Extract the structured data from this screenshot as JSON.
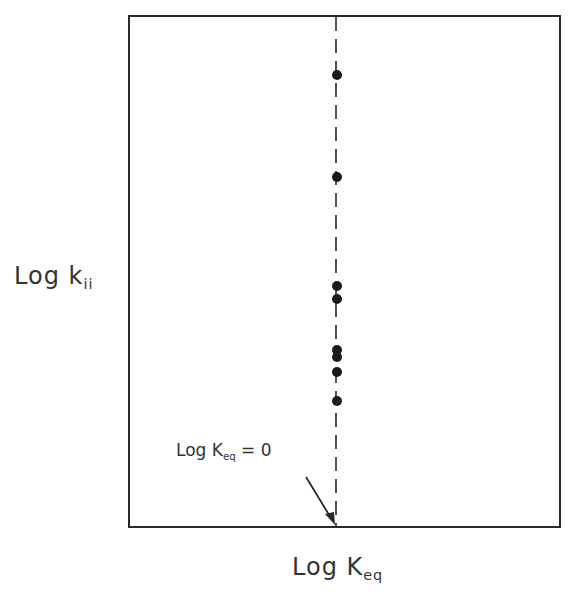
{
  "chart_data": {
    "type": "scatter",
    "title": "",
    "xlabel": "Log K_eq",
    "ylabel": "Log k_ii",
    "xlabel_main": "Log K",
    "xlabel_sub": "eq",
    "ylabel_main": "Log k",
    "ylabel_sub": "ii",
    "grid": false,
    "legend": null,
    "axis_ticks": "none",
    "reference_line": {
      "orientation": "vertical",
      "style": "dashed",
      "x": 0,
      "label": "Log K_eq = 0"
    },
    "annotation": {
      "main": "Log K",
      "sub": "eq",
      "suffix": " = 0",
      "arrow_to": "bottom axis at Log K_eq = 0"
    },
    "series": [
      {
        "name": "points",
        "marker": "filled-circle",
        "x": [
          0,
          0,
          0,
          0,
          0,
          0,
          0,
          0
        ],
        "y_pixel": [
          75,
          177,
          286,
          299,
          350,
          357,
          372,
          401
        ],
        "y_relative_from_bottom": [
          0.88,
          0.68,
          0.47,
          0.44,
          0.34,
          0.33,
          0.3,
          0.25
        ]
      }
    ]
  },
  "plot": {
    "box": {
      "left": 129,
      "top": 16,
      "right": 560,
      "bottom": 527
    },
    "ref_x": 336,
    "colors": {
      "line": "#2a2a2a",
      "marker": "#1a1a1a",
      "background": "#ffffff"
    }
  }
}
